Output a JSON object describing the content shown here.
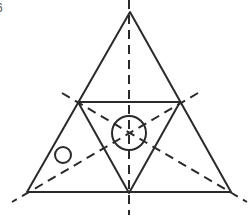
{
  "figure": {
    "label": "6",
    "stroke_color": "#2a2a2a",
    "outer_triangle": {
      "apex": [
        130,
        12
      ],
      "left": [
        27,
        192
      ],
      "right": [
        231,
        192
      ]
    },
    "inner_triangle": {
      "left": [
        78,
        102
      ],
      "right": [
        180,
        102
      ],
      "bottom": [
        129,
        193
      ]
    },
    "central_circle": {
      "cx": 129,
      "cy": 133,
      "r": 17
    },
    "small_circle": {
      "cx": 63,
      "cy": 155,
      "r": 8
    },
    "dashed_axes": [
      {
        "name": "vertical",
        "from": [
          129,
          0
        ],
        "to": [
          129,
          215
        ]
      },
      {
        "name": "left-to-right",
        "from": [
          62,
          93
        ],
        "to": [
          247,
          202
        ]
      },
      {
        "name": "right-to-left",
        "from": [
          198,
          93
        ],
        "to": [
          12,
          202
        ]
      }
    ]
  }
}
